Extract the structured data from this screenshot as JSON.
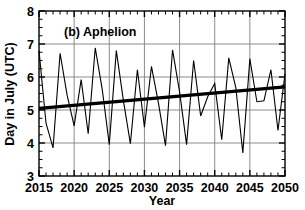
{
  "figure": {
    "panel_label": "(b) Aphelion",
    "x_axis_title": "Year",
    "y_axis_title": "Day in July (UTC)",
    "y_tick_labels": [
      "3",
      "4",
      "5",
      "6",
      "7",
      "8"
    ],
    "x_tick_labels": [
      "2015",
      "2020",
      "2025",
      "2030",
      "2035",
      "2040",
      "2045",
      "2050"
    ],
    "colors": {
      "data_line": "#000000",
      "trend_line": "#000000",
      "grid": "#808080",
      "axis": "#000000",
      "background": "#ffffff"
    }
  },
  "chart_data": {
    "type": "line",
    "title": "(b) Aphelion",
    "xlabel": "Year",
    "ylabel": "Day in July (UTC)",
    "xlim": [
      2015,
      2050
    ],
    "ylim": [
      3,
      8
    ],
    "xticks": [
      2015,
      2020,
      2025,
      2030,
      2035,
      2040,
      2045,
      2050
    ],
    "yticks": [
      3,
      4,
      5,
      6,
      7,
      8
    ],
    "minor_xtick_interval": 1,
    "minor_ytick_interval": 0.25,
    "grid": true,
    "grid_axes": "both-major",
    "legend": null,
    "series": [
      {
        "name": "Aphelion day in July",
        "type": "line",
        "x": [
          2015,
          2016,
          2017,
          2018,
          2019,
          2020,
          2021,
          2022,
          2023,
          2024,
          2025,
          2026,
          2027,
          2028,
          2029,
          2030,
          2031,
          2032,
          2033,
          2034,
          2035,
          2036,
          2037,
          2038,
          2039,
          2040,
          2041,
          2042,
          2043,
          2044,
          2045,
          2046,
          2047,
          2048,
          2049,
          2050
        ],
        "values": [
          6.8,
          4.6,
          3.85,
          6.72,
          5.45,
          4.52,
          5.92,
          4.28,
          6.88,
          5.62,
          3.95,
          6.8,
          5.3,
          3.98,
          6.22,
          4.48,
          6.32,
          5.2,
          3.92,
          6.82,
          5.55,
          3.95,
          6.5,
          4.82,
          5.4,
          5.8,
          4.1,
          6.58,
          5.68,
          3.7,
          6.55,
          5.25,
          5.28,
          6.22,
          4.38,
          6.1
        ]
      },
      {
        "name": "Linear trend",
        "type": "line",
        "style": "thick",
        "x": [
          2015,
          2050
        ],
        "values": [
          5.05,
          5.7
        ]
      }
    ]
  }
}
